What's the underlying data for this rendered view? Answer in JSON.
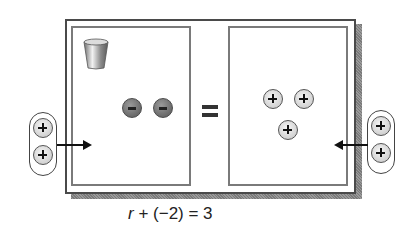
{
  "diagram": {
    "left_side": {
      "variable_cup": {
        "icon": "cup-icon",
        "represents": "r"
      },
      "counters": [
        {
          "sign": "negative",
          "symbol": "−"
        },
        {
          "sign": "negative",
          "symbol": "−"
        }
      ]
    },
    "equals_symbol": "=",
    "right_side": {
      "counters": [
        {
          "sign": "positive",
          "symbol": "+"
        },
        {
          "sign": "positive",
          "symbol": "+"
        },
        {
          "sign": "positive",
          "symbol": "+"
        }
      ]
    },
    "left_addition": {
      "counters": [
        {
          "sign": "positive",
          "symbol": "+"
        },
        {
          "sign": "positive",
          "symbol": "+"
        }
      ],
      "arrow_direction": "right"
    },
    "right_addition": {
      "counters": [
        {
          "sign": "positive",
          "symbol": "+"
        },
        {
          "sign": "positive",
          "symbol": "+"
        }
      ],
      "arrow_direction": "left"
    },
    "equation": {
      "variable": "r",
      "rest": " + (−2) = 3"
    }
  }
}
